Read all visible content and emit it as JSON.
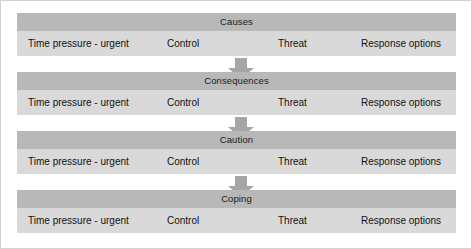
{
  "diagram": {
    "type": "vertical-flow",
    "title": "",
    "columns": [
      "Time pressure - urgent",
      "Control",
      "Threat",
      "Response options"
    ],
    "colors": {
      "stage_title_bg": "#b8b8b8",
      "stage_row_bg": "#d9d9d9",
      "arrow": "#a6a6a6",
      "text": "#111111",
      "border": "#d2d2d2",
      "background": "#ffffff"
    },
    "stages": [
      {
        "title": "Causes",
        "cells": [
          "Time pressure - urgent",
          "Control",
          "Threat",
          "Response options"
        ]
      },
      {
        "title": "Consequences",
        "cells": [
          "Time pressure - urgent",
          "Control",
          "Threat",
          "Response options"
        ]
      },
      {
        "title": "Caution",
        "cells": [
          "Time pressure - urgent",
          "Control",
          "Threat",
          "Response options"
        ]
      },
      {
        "title": "Coping",
        "cells": [
          "Time pressure - urgent",
          "Control",
          "Threat",
          "Response options"
        ]
      }
    ],
    "connectors": [
      {
        "name": "arrow-down-1",
        "from": "Causes",
        "to": "Consequences"
      },
      {
        "name": "arrow-down-2",
        "from": "Consequences",
        "to": "Caution"
      },
      {
        "name": "arrow-down-3",
        "from": "Caution",
        "to": "Coping"
      }
    ]
  }
}
